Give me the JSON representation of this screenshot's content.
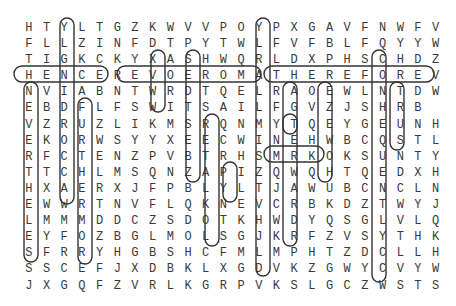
{
  "puzzle": {
    "grid": [
      "HTYLTGZKWVVPOYPXGAVFNWFV",
      "FLLZINFDTPYTWLFVFBLFQYYW",
      "TIGKCKYXASHWQRLDXPHSCHDZ",
      "HENCEREVOEROMATHEREFOREV",
      "NVIABNTWRDTQELRAOEWLNTDW",
      "EBDFLFSWITSAILFGVZJSHRB",
      "VZRUZLIKMSRQNMYTQEYGEUNH",
      "EKORWSYYXEECWINEHWBCQSTL",
      "RFCTENZPVBTRHSMRKOKSUNTY",
      "TTCHLMSQNZAPIZQWQHTQEDXH",
      "HXAERXJFPBLYLTJAWUBCNCLN",
      "EWWRTNVFLQKNEVCRBKDZTWYJ",
      "LMMMDDCZSDOTKHWDYQSGLVLQ",
      "EYFOZBGLMOLSGJKRFZVSYTHK",
      "SFRRYHGBSHCFMLMPHTZDCLLH",
      "SSCEFJXDBKLXGDVKZGWYCVYW",
      "JXGQFZVRLKGRPVKSLGCZWSTS"
    ],
    "highlighted_words": [
      "HENCE",
      "THEREFORE",
      "MOREOVER",
      "BUT",
      "THUS",
      "NEEDLESS",
      "YET",
      "FURTHERMORE",
      "WHEN",
      "TOO",
      "ALSO",
      "HOWEVER",
      "NOW",
      "YES",
      "SO"
    ]
  }
}
